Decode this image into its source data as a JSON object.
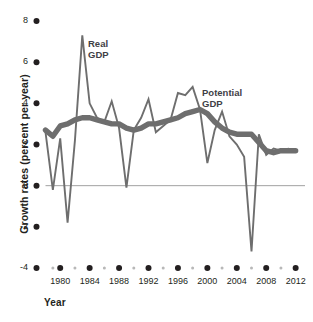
{
  "chart_data": {
    "type": "line",
    "title": "",
    "xlabel": "Year",
    "ylabel": "Growth rates (percent per year)",
    "xlim": [
      1978,
      2013
    ],
    "ylim": [
      -4,
      8
    ],
    "grid": false,
    "zero_line": true,
    "legend_position": "inline-annotations",
    "y_ticks": [
      8,
      6,
      4,
      2,
      0,
      -2,
      -4
    ],
    "y_tick_labels": [
      "8",
      "6",
      "4",
      "2",
      "0",
      "-2",
      "-4"
    ],
    "x_ticks": [
      1980,
      1984,
      1988,
      1992,
      1996,
      2000,
      2004,
      2008,
      2012
    ],
    "x_tick_labels": [
      "1980",
      "1984",
      "1988",
      "1992",
      "1996",
      "2000",
      "2004",
      "2008",
      "2012"
    ],
    "x_minor_ticks": [
      1979,
      1982,
      1986,
      1990,
      1994,
      1998,
      2002,
      2006,
      2010
    ],
    "series": [
      {
        "name": "Real GDP",
        "label": "Real\nGDP",
        "color": "#6e6e6e",
        "width": 1.9,
        "x": [
          1978,
          1979,
          1980,
          1981,
          1982,
          1983,
          1984,
          1985,
          1986,
          1987,
          1988,
          1989,
          1990,
          1991,
          1992,
          1993,
          1994,
          1995,
          1996,
          1997,
          1998,
          1999,
          2000,
          2001,
          2002,
          2003,
          2004,
          2005,
          2006,
          2007,
          2008,
          2009,
          2010,
          2011,
          2012
        ],
        "values": [
          2.6,
          -0.2,
          2.3,
          -1.8,
          2.2,
          7.3,
          4.0,
          3.3,
          3.1,
          4.1,
          2.8,
          -0.1,
          2.7,
          3.3,
          4.2,
          2.6,
          2.9,
          3.2,
          4.5,
          4.4,
          4.8,
          3.7,
          1.1,
          2.7,
          3.6,
          2.4,
          2.0,
          1.4,
          -3.2,
          2.5,
          1.5,
          1.8,
          1.7,
          1.8,
          1.7
        ]
      },
      {
        "name": "Potential GDP",
        "label": "Potential\nGDP",
        "color": "#6e6e6e",
        "width": 5.4,
        "x": [
          1978,
          1979,
          1980,
          1981,
          1982,
          1983,
          1984,
          1985,
          1986,
          1987,
          1988,
          1989,
          1990,
          1991,
          1992,
          1993,
          1994,
          1995,
          1996,
          1997,
          1998,
          1999,
          2000,
          2001,
          2002,
          2003,
          2004,
          2005,
          2006,
          2007,
          2008,
          2009,
          2010,
          2011,
          2012
        ],
        "values": [
          2.7,
          2.4,
          2.9,
          3.0,
          3.2,
          3.3,
          3.3,
          3.2,
          3.1,
          3.0,
          3.0,
          2.8,
          2.7,
          2.8,
          3.0,
          3.0,
          3.1,
          3.2,
          3.3,
          3.5,
          3.6,
          3.7,
          3.5,
          3.1,
          2.8,
          2.6,
          2.5,
          2.5,
          2.5,
          2.1,
          1.7,
          1.6,
          1.7,
          1.7,
          1.7
        ]
      }
    ],
    "annotations": [
      {
        "text": "Real GDP",
        "x": 1983.6,
        "y": 6.4
      },
      {
        "text": "Potential GDP",
        "x": 1999.5,
        "y": 4.1
      }
    ],
    "colors": {
      "line": "#6e6e6e",
      "text": "#231f20",
      "label_text": "#3f3f46",
      "zero_line": "#8a8a8a",
      "major_tick_dot": "#231f20",
      "minor_tick_dot": "#b8b8b8",
      "background": "#ffffff"
    }
  }
}
